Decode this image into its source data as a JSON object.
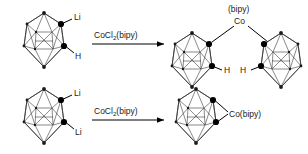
{
  "diagram": {
    "background_color": "#ffffff",
    "line_color": "#1a1a1a",
    "vertex_color": "#000000"
  },
  "reactions": [
    {
      "id": "top-reaction",
      "reactant": {
        "cage_name": "carborane-cage",
        "substituents": [
          {
            "label": "Li",
            "position": "upper-right"
          },
          {
            "label": "H",
            "position": "lower-right"
          }
        ]
      },
      "arrow": {
        "reagent_main": "CoCl",
        "reagent_sub": "2",
        "reagent_tail": "(bipy)",
        "direction": "right"
      },
      "product": {
        "metal_ligand_top": "(bipy)",
        "metal_center": "Co",
        "left_cage": {
          "substituents": [
            {
              "label": "H",
              "position": "lower-right"
            }
          ]
        },
        "right_cage": {
          "substituents": [
            {
              "label": "H",
              "position": "lower-left"
            }
          ]
        }
      }
    },
    {
      "id": "bottom-reaction",
      "reactant": {
        "cage_name": "carborane-cage",
        "substituents": [
          {
            "label": "Li",
            "position": "upper-right"
          },
          {
            "label": "Li",
            "position": "lower-right"
          }
        ]
      },
      "arrow": {
        "reagent_main": "CoCl",
        "reagent_sub": "2",
        "reagent_tail": "(bipy)",
        "direction": "right"
      },
      "product": {
        "metal_label": "Co(bipy)",
        "cage": {
          "substituents": []
        }
      }
    }
  ]
}
